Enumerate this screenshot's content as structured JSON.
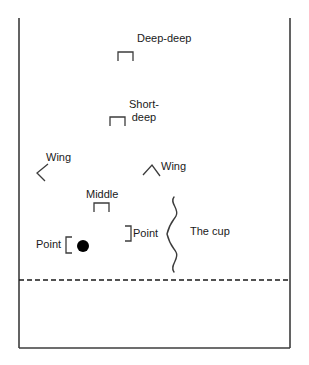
{
  "diagram": {
    "colors": {
      "line": "#3c3c3c",
      "text": "#1a1a1a",
      "ball": "#000000",
      "background": "#ffffff"
    },
    "field": {
      "left_sideline": "left-sideline",
      "right_sideline": "right-sideline",
      "end_line": "end-line",
      "restraining_line": "restraining-line-dashed"
    },
    "labels": [
      {
        "id": "deep-deep",
        "text": "Deep-deep",
        "x": 137,
        "y": 33,
        "marker": "square-bracket-up",
        "marker_x": 118,
        "marker_y": 52
      },
      {
        "id": "short-deep",
        "text": "Short-\ndeep",
        "x": 129,
        "y": 99,
        "marker": "square-bracket-up",
        "marker_x": 110,
        "marker_y": 117
      },
      {
        "id": "wing-left",
        "text": "Wing",
        "x": 46,
        "y": 152,
        "marker": "angle-bracket-left",
        "marker_x": 37,
        "marker_y": 166
      },
      {
        "id": "wing-right",
        "text": "Wing",
        "x": 161,
        "y": 161,
        "marker": "caret-up",
        "marker_x": 143,
        "marker_y": 163
      },
      {
        "id": "middle",
        "text": "Middle",
        "x": 86,
        "y": 189,
        "marker": "square-bracket-up",
        "marker_x": 94,
        "marker_y": 203
      },
      {
        "id": "point-right",
        "text": "Point",
        "x": 134,
        "y": 228,
        "marker": "bracket-close",
        "marker_x": 125,
        "marker_y": 226
      },
      {
        "id": "point-left",
        "text": "Point",
        "x": 36,
        "y": 239,
        "marker": "bracket-open",
        "marker_x": 66,
        "marker_y": 237
      },
      {
        "id": "the-cup",
        "text": "The cup",
        "x": 190,
        "y": 232,
        "marker": "curly-brace-right",
        "marker_x": 172,
        "marker_y": 197
      }
    ],
    "ball": {
      "id": "ball-marker",
      "cx": 83,
      "cy": 246,
      "r": 6
    }
  }
}
